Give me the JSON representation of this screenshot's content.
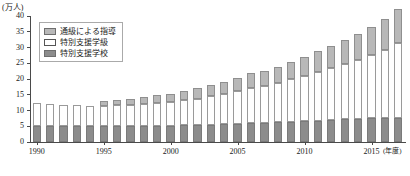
{
  "chart_data": {
    "type": "bar",
    "stacked": true,
    "title": "",
    "xlabel": "(年度)",
    "ylabel": "(万人)",
    "ylim": [
      0,
      40
    ],
    "ytick_values": [
      0,
      5,
      10,
      15,
      20,
      25,
      30,
      35,
      40
    ],
    "ytick_labels": [
      "0",
      "5",
      "10",
      "15",
      "20",
      "25",
      "30",
      "35",
      "40"
    ],
    "grid": false,
    "legend_position": "upper-left",
    "categories": [
      1990,
      1991,
      1992,
      1993,
      1994,
      1995,
      1996,
      1997,
      1998,
      1999,
      2000,
      2001,
      2002,
      2003,
      2004,
      2005,
      2006,
      2007,
      2008,
      2009,
      2010,
      2011,
      2012,
      2013,
      2014,
      2015,
      2016,
      2017
    ],
    "xtick_labels": [
      "1990",
      "1995",
      "2000",
      "2005",
      "2010",
      "2015"
    ],
    "xtick_values": [
      1990,
      1995,
      2000,
      2005,
      2010,
      2015
    ],
    "series": [
      {
        "name": "特別支援学校",
        "color": "#8c8c8c",
        "values": [
          5.0,
          5.0,
          5.0,
          5.0,
          5.0,
          5.0,
          5.0,
          5.0,
          5.1,
          5.1,
          5.2,
          5.3,
          5.4,
          5.5,
          5.6,
          5.8,
          6.0,
          6.1,
          6.2,
          6.4,
          6.6,
          6.8,
          7.0,
          7.2,
          7.4,
          7.5,
          7.6,
          7.7
        ]
      },
      {
        "name": "特別支援学級",
        "color": "#ffffff",
        "values": [
          7.4,
          7.1,
          6.8,
          6.6,
          6.5,
          6.5,
          6.6,
          6.7,
          6.9,
          7.2,
          7.5,
          7.9,
          8.4,
          9.0,
          9.6,
          10.4,
          11.3,
          11.8,
          12.5,
          13.5,
          14.5,
          15.5,
          16.4,
          17.5,
          18.7,
          20.1,
          21.7,
          23.6
        ]
      },
      {
        "name": "通級による指導",
        "color": "#b8b8b8",
        "values": [
          0.0,
          0.0,
          0.0,
          0.0,
          0.0,
          1.6,
          1.8,
          2.0,
          2.2,
          2.5,
          2.7,
          3.1,
          3.3,
          3.5,
          3.9,
          4.2,
          4.5,
          4.6,
          5.0,
          5.4,
          6.0,
          6.5,
          7.1,
          7.8,
          8.3,
          9.0,
          9.8,
          10.9
        ]
      }
    ]
  },
  "legend": {
    "items": [
      {
        "label": "通級による指導",
        "swatch": "#b8b8b8"
      },
      {
        "label": "特別支援学級",
        "swatch": "#ffffff"
      },
      {
        "label": "特別支援学校",
        "swatch": "#8c8c8c"
      }
    ]
  },
  "axes": {
    "y_unit": "(万人)",
    "x_unit": "(年度)"
  }
}
